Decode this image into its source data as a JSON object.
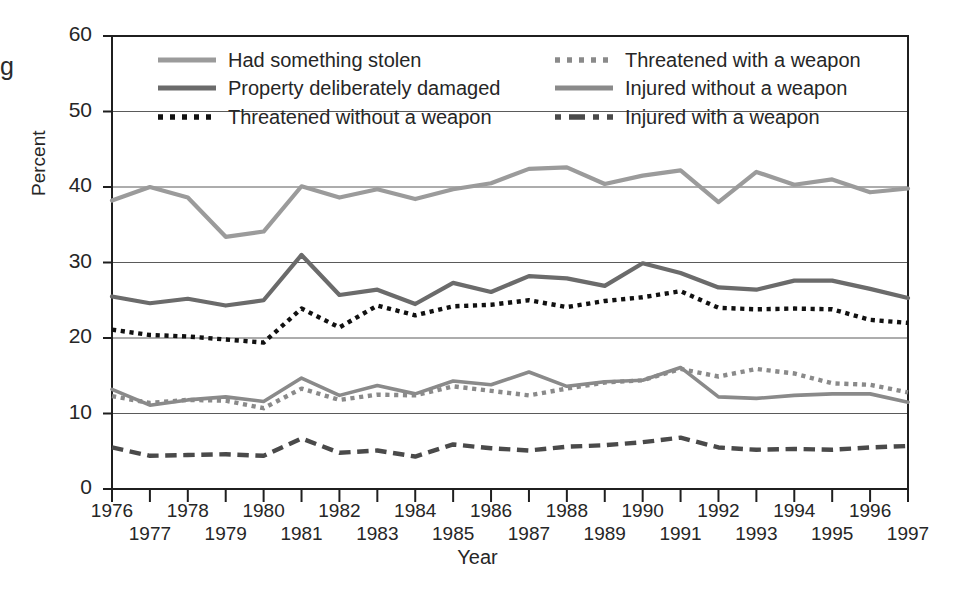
{
  "chart_data": {
    "type": "line",
    "title": "",
    "xlabel": "Year",
    "ylabel": "Percent",
    "ylim": [
      0,
      60
    ],
    "yticks": [
      0,
      10,
      20,
      30,
      40,
      50,
      60
    ],
    "xlim": [
      1976,
      1997
    ],
    "grid": "horizontal",
    "legend_position": "top-inside-two-columns",
    "categories": [
      1976,
      1977,
      1978,
      1979,
      1980,
      1981,
      1982,
      1983,
      1984,
      1985,
      1986,
      1987,
      1988,
      1989,
      1990,
      1991,
      1992,
      1993,
      1994,
      1995,
      1996,
      1997
    ],
    "series": [
      {
        "name": "Had something stolen",
        "color": "#9b9b9b",
        "style": "solid",
        "values": [
          38.2,
          40.0,
          38.6,
          33.4,
          34.1,
          40.1,
          38.6,
          39.7,
          38.4,
          39.7,
          40.5,
          42.4,
          42.6,
          40.4,
          41.5,
          42.2,
          38.0,
          42.0,
          40.3,
          41.0,
          39.3,
          39.8
        ]
      },
      {
        "name": "Property deliberately damaged",
        "color": "#6b6b6b",
        "style": "solid",
        "values": [
          25.5,
          24.6,
          25.2,
          24.3,
          25.0,
          31.0,
          25.7,
          26.4,
          24.5,
          27.3,
          26.1,
          28.2,
          27.9,
          26.9,
          29.9,
          28.6,
          26.7,
          26.4,
          27.6,
          27.6,
          26.5,
          25.3
        ]
      },
      {
        "name": "Threatened without a weapon",
        "color": "#111111",
        "style": "dotted",
        "values": [
          21.1,
          20.4,
          20.2,
          19.8,
          19.4,
          23.9,
          21.4,
          24.3,
          23.0,
          24.2,
          24.4,
          25.0,
          24.1,
          24.9,
          25.4,
          26.2,
          24.0,
          23.8,
          23.9,
          23.8,
          22.4,
          22.0
        ]
      },
      {
        "name": "Threatened with a weapon",
        "color": "#8a8a8a",
        "style": "dotted",
        "values": [
          12.3,
          11.4,
          11.8,
          11.7,
          10.7,
          13.3,
          11.8,
          12.5,
          12.4,
          13.6,
          13.0,
          12.4,
          13.3,
          14.1,
          14.4,
          15.9,
          14.9,
          15.9,
          15.3,
          14.0,
          13.8,
          12.8
        ]
      },
      {
        "name": "Injured without a weapon",
        "color": "#8a8a8a",
        "style": "solid",
        "values": [
          13.2,
          11.1,
          11.8,
          12.2,
          11.6,
          14.7,
          12.4,
          13.7,
          12.6,
          14.3,
          13.8,
          15.5,
          13.6,
          14.2,
          14.4,
          16.1,
          12.2,
          12.0,
          12.4,
          12.6,
          12.6,
          11.5
        ]
      },
      {
        "name": "Injured with a weapon",
        "color": "#4a4a4a",
        "style": "dashed",
        "values": [
          5.5,
          4.4,
          4.5,
          4.6,
          4.4,
          6.7,
          4.8,
          5.1,
          4.3,
          5.9,
          5.4,
          5.1,
          5.6,
          5.8,
          6.2,
          6.8,
          5.5,
          5.2,
          5.3,
          5.2,
          5.5,
          5.7
        ]
      }
    ]
  },
  "legend": {
    "column_left": [
      {
        "label": "Had something stolen"
      },
      {
        "label": "Property deliberately damaged"
      },
      {
        "label": "Threatened without a weapon"
      }
    ],
    "column_right": [
      {
        "label": "Threatened with a weapon"
      },
      {
        "label": "Injured without a weapon"
      },
      {
        "label": "Injured with a weapon"
      }
    ]
  },
  "axes": {
    "y_title": "Percent",
    "x_title": "Year",
    "y_ticks": [
      "0",
      "10",
      "20",
      "30",
      "40",
      "50",
      "60"
    ],
    "x_ticks_upper": [
      "1976",
      "1978",
      "1980",
      "1982",
      "1984",
      "1986",
      "1988",
      "1990",
      "1992",
      "1994",
      "1996"
    ],
    "x_ticks_lower": [
      "1977",
      "1979",
      "1981",
      "1983",
      "1985",
      "1987",
      "1989",
      "1991",
      "1993",
      "1995",
      "1997"
    ]
  },
  "page": {
    "edge_glyph": "g"
  }
}
